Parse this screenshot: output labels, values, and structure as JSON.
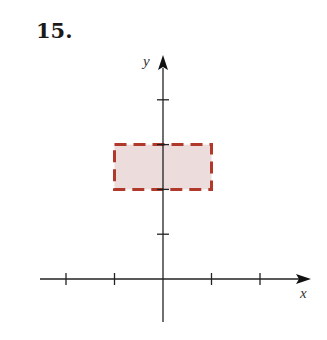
{
  "problem": {
    "number": "15."
  },
  "chart_data": {
    "type": "region",
    "title": "",
    "xlabel": "x",
    "ylabel": "y",
    "x_ticks": [
      -2,
      -1,
      1,
      2
    ],
    "y_ticks": [
      1,
      2,
      3,
      4
    ],
    "xlim": [
      -2.5,
      3
    ],
    "ylim": [
      -0.9,
      5
    ],
    "tick_labels_shown": false,
    "grid": false,
    "region": {
      "shape": "rectangle",
      "x_range": [
        -1,
        1
      ],
      "y_range": [
        2,
        3
      ],
      "boundary": "dashed",
      "boundary_color": "#b0392b",
      "fill_color": "#ecdcdc",
      "description": "-1 < x < 1, 2 < y < 3 (boundary not included)"
    }
  }
}
